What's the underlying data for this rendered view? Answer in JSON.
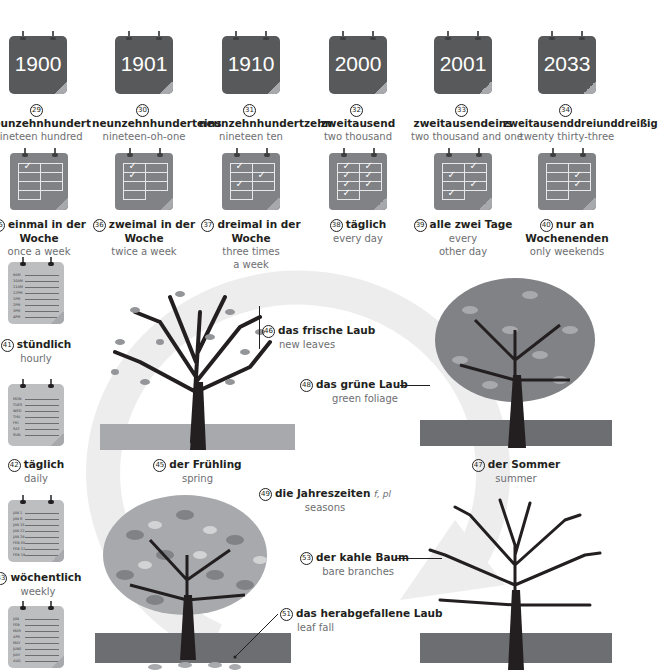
{
  "years": [
    {
      "num": "29",
      "year": "1900",
      "de": "neunzehnhundert",
      "en": "nineteen hundred"
    },
    {
      "num": "30",
      "year": "1901",
      "de": "neunzehnhunderteins",
      "en": "nineteen-oh-one"
    },
    {
      "num": "31",
      "year": "1910",
      "de": "neunzehnhundertzehn",
      "en": "nineteen ten"
    },
    {
      "num": "32",
      "year": "2000",
      "de": "zweitausend",
      "en": "two thousand"
    },
    {
      "num": "33",
      "year": "2001",
      "de": "zweitausendeins",
      "en": "two thousand and one"
    },
    {
      "num": "34",
      "year": "2033",
      "de": "zweitausenddreiunddreißig",
      "en": "twenty thirty-three"
    }
  ],
  "frequency": [
    {
      "num": "35",
      "de1": "einmal in der",
      "de2": "Woche",
      "en1": "once a week",
      "en2": ""
    },
    {
      "num": "36",
      "de1": "zweimal in der",
      "de2": "Woche",
      "en1": "twice a week",
      "en2": ""
    },
    {
      "num": "37",
      "de1": "dreimal in der",
      "de2": "Woche",
      "en1": "three times",
      "en2": "a week"
    },
    {
      "num": "38",
      "de1": "täglich",
      "de2": "",
      "en1": "every day",
      "en2": ""
    },
    {
      "num": "39",
      "de1": "alle zwei Tage",
      "de2": "",
      "en1": "every",
      "en2": "other day"
    },
    {
      "num": "40",
      "de1": "nur an",
      "de2": "Wochenenden",
      "en1": "only weekends",
      "en2": ""
    }
  ],
  "check_glyph": "✓",
  "lists": [
    {
      "num": "41",
      "de": "stündlich",
      "en": "hourly",
      "rows": [
        "9AM",
        "10AM",
        "11AM",
        "12PM",
        "1PM",
        "2PM",
        "3PM",
        "4PM"
      ]
    },
    {
      "num": "42",
      "de": "täglich",
      "en": "daily",
      "rows": [
        "MON",
        "TUES",
        "WED",
        "THU",
        "FRI",
        "SAT",
        "SUN"
      ]
    },
    {
      "num": "43",
      "de": "wöchentlich",
      "en": "weekly",
      "rows": [
        "JAN 1",
        "JAN 8",
        "JAN 15",
        "JAN 22",
        "JAN 29",
        "FEB 05",
        "FEB 12",
        "FEB 19"
      ]
    },
    {
      "num": "44",
      "de": "",
      "en": "",
      "rows": [
        "JAN",
        "FEB",
        "MAR",
        "APR",
        "MAY",
        "JUNE",
        "JULY",
        "AUG"
      ]
    }
  ],
  "seasons": {
    "spring": {
      "num": "45",
      "de": "der Frühling",
      "en": "spring"
    },
    "new_leaves": {
      "num": "46",
      "de": "das frische Laub",
      "en": "new leaves"
    },
    "summer": {
      "num": "47",
      "de": "der Sommer",
      "en": "summer"
    },
    "green_foliage": {
      "num": "48",
      "de": "das grüne Laub",
      "en": "green foliage"
    },
    "seasons": {
      "num": "49",
      "de": "die Jahreszeiten",
      "gram": "f, pl",
      "en": "seasons"
    },
    "leaf_fall": {
      "num": "51",
      "de": "das herabgefallene Laub",
      "en": "leaf fall"
    },
    "bare": {
      "num": "53",
      "de": "der kahle Baum",
      "en": "bare branches"
    }
  },
  "colors": {
    "calendar_dark": "#58595b",
    "calendar_mid": "#808285",
    "calendar_light": "#bcbec0",
    "ground_light": "#a7a9ac",
    "ground_dark": "#6d6e71",
    "arrow": "#ededee",
    "trunk": "#231f20"
  }
}
